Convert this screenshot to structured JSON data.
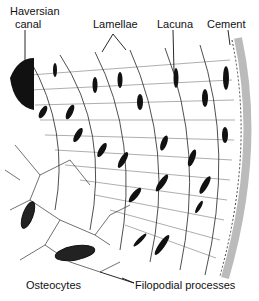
{
  "diagram": {
    "labels": {
      "haversian_canal_line1": "Haversian",
      "haversian_canal_line2": "canal",
      "lamellae": "Lamellae",
      "lacuna": "Lacuna",
      "cement": "Cement",
      "osteocytes": "Osteocytes",
      "filopodial_processes": "Filopodial processes"
    },
    "colors": {
      "ink": "#111111",
      "background": "#ffffff",
      "stipple": "#9a9a9a"
    }
  }
}
